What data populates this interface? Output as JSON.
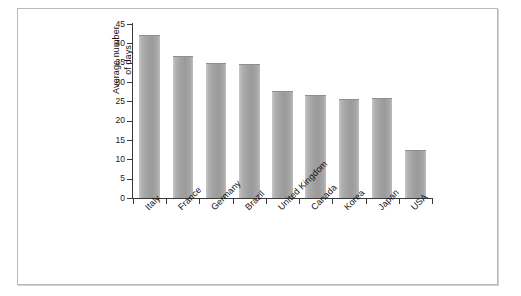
{
  "chart_data": {
    "type": "bar",
    "title": "",
    "subtitle": "",
    "xlabel": "",
    "ylabel_lines": [
      "Average number",
      "of days"
    ],
    "ylabel": "Average number of days",
    "categories": [
      "Italy",
      "France",
      "Germany",
      "Brazil",
      "United Kingdom",
      "Canada",
      "Korea",
      "Japan",
      "USA"
    ],
    "values": [
      42,
      36.5,
      34.7,
      34.3,
      27.5,
      26.3,
      25.4,
      25.6,
      12.2
    ],
    "ylim": [
      0,
      45
    ],
    "ytick_labels": [
      "0",
      "5",
      "10",
      "15",
      "20",
      "25",
      "30",
      "35",
      "40",
      "45"
    ],
    "ytick_values": [
      0,
      5,
      10,
      15,
      20,
      25,
      30,
      35,
      40,
      45
    ],
    "grid": false,
    "legend": null,
    "legend_position": "none",
    "bar_color": "#a8a8a8",
    "axis_color": "#3a3a3a",
    "frame_color": "#b9b9b9",
    "background_color": "#ffffff"
  }
}
